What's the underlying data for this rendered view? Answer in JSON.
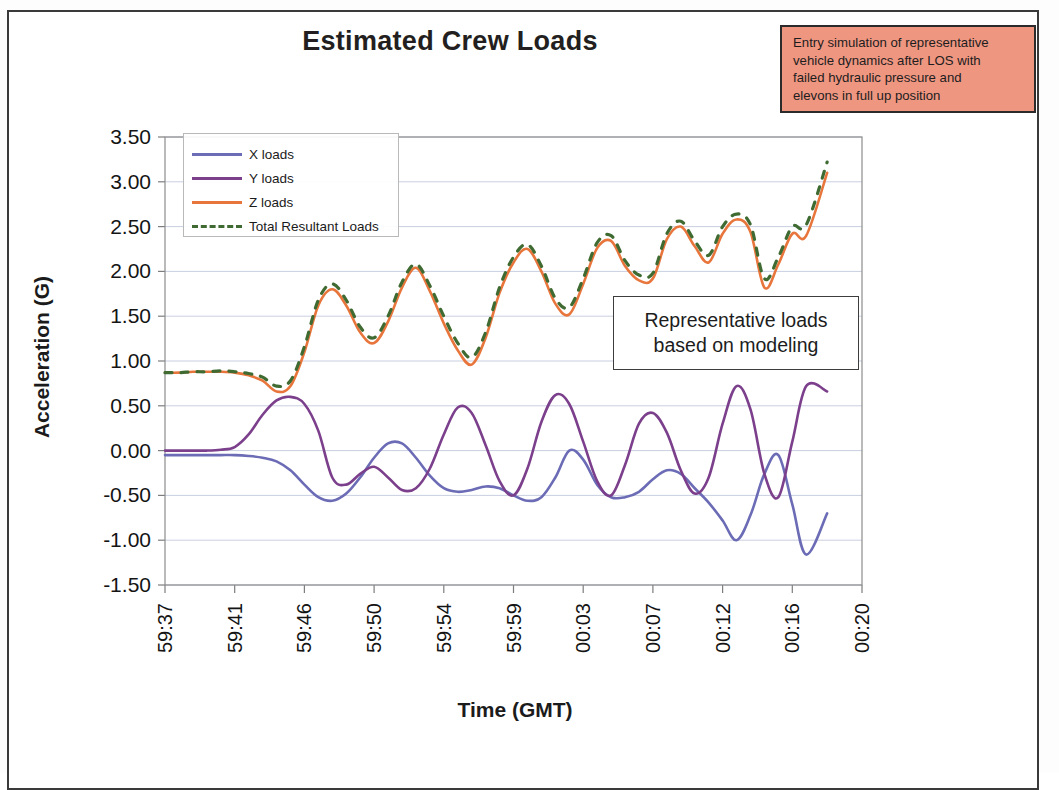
{
  "title": "Estimated Crew Loads",
  "annotations": {
    "red_note": "Entry simulation of representative vehicle dynamics after LOS with failed hydraulic pressure and elevons in full up position",
    "red_note_lines": [
      "Entry simulation of representative",
      "vehicle dynamics after LOS with",
      "failed hydraulic pressure and",
      "elevons in full up position"
    ],
    "white_note_line1": "Representative loads",
    "white_note_line2": "based on modeling"
  },
  "colors": {
    "x_loads": "#6b6cb5",
    "y_loads": "#7b3f8c",
    "z_loads": "#e8763c",
    "total_resultant": "#3f6b32",
    "red_note_bg": "#ef9681",
    "frame": "#3a3a3a",
    "grid": "#c9cfe0"
  },
  "chart_data": {
    "type": "line",
    "title": "Estimated Crew Loads",
    "xlabel": "Time (GMT)",
    "ylabel": "Acceleration (G)",
    "ylim": [
      -1.5,
      3.5
    ],
    "ytick_step": 0.5,
    "ytick_labels": [
      "3.50",
      "3.00",
      "2.50",
      "2.00",
      "1.50",
      "1.00",
      "0.50",
      "0.00",
      "-0.50",
      "-1.00",
      "-1.50"
    ],
    "xtick_labels": [
      "59:37",
      "59:41",
      "59:46",
      "59:50",
      "59:54",
      "59:59",
      "00:03",
      "00:07",
      "00:12",
      "00:16",
      "00:20"
    ],
    "grid": true,
    "legend_position": "top-left-inside",
    "x_range": [
      0,
      100
    ],
    "series": [
      {
        "name": "X loads",
        "color": "#6b6cb5",
        "style": "solid",
        "x": [
          0,
          2,
          4,
          6,
          8,
          10,
          12,
          14,
          16,
          18,
          20,
          22,
          24,
          26,
          28,
          30,
          32,
          34,
          36,
          38,
          40,
          42,
          44,
          46,
          48,
          50,
          52,
          54,
          56,
          58,
          60,
          62,
          64,
          66,
          68,
          70,
          72,
          74,
          76,
          78,
          80,
          82,
          84,
          86,
          88,
          90,
          92
        ],
        "values": [
          -0.05,
          -0.05,
          -0.05,
          -0.05,
          -0.05,
          -0.05,
          -0.06,
          -0.08,
          -0.12,
          -0.22,
          -0.38,
          -0.52,
          -0.56,
          -0.48,
          -0.3,
          -0.08,
          0.08,
          0.08,
          -0.08,
          -0.28,
          -0.42,
          -0.46,
          -0.44,
          -0.4,
          -0.42,
          -0.5,
          -0.56,
          -0.52,
          -0.3,
          0.0,
          -0.1,
          -0.38,
          -0.52,
          -0.52,
          -0.46,
          -0.32,
          -0.22,
          -0.26,
          -0.42,
          -0.58,
          -0.78,
          -1.0,
          -0.72,
          -0.26,
          -0.05,
          -0.6,
          -1.16
        ]
      },
      {
        "name": "Y loads",
        "color": "#7b3f8c",
        "style": "solid",
        "x": [
          0,
          2,
          4,
          6,
          8,
          10,
          12,
          14,
          16,
          18,
          20,
          22,
          24,
          26,
          28,
          30,
          32,
          34,
          36,
          38,
          40,
          42,
          44,
          46,
          48,
          50,
          52,
          54,
          56,
          58,
          60,
          62,
          64,
          66,
          68,
          70,
          72,
          74,
          76,
          78,
          80,
          82,
          84,
          86,
          88,
          90,
          92
        ],
        "values": [
          0.0,
          0.0,
          0.0,
          0.0,
          0.01,
          0.04,
          0.18,
          0.4,
          0.56,
          0.6,
          0.52,
          0.22,
          -0.3,
          -0.38,
          -0.26,
          -0.18,
          -0.3,
          -0.44,
          -0.42,
          -0.2,
          0.18,
          0.48,
          0.42,
          0.06,
          -0.34,
          -0.5,
          -0.2,
          0.32,
          0.62,
          0.52,
          0.1,
          -0.34,
          -0.5,
          -0.16,
          0.3,
          0.42,
          0.2,
          -0.22,
          -0.48,
          -0.3,
          0.3,
          0.72,
          0.46,
          -0.26,
          -0.52,
          0.1,
          0.72
        ]
      },
      {
        "name": "Z loads",
        "color": "#e8763c",
        "style": "solid",
        "x": [
          0,
          2,
          4,
          6,
          8,
          10,
          12,
          14,
          16,
          18,
          20,
          22,
          24,
          26,
          28,
          30,
          32,
          34,
          36,
          38,
          40,
          42,
          44,
          46,
          48,
          50,
          52,
          54,
          56,
          58,
          60,
          62,
          64,
          66,
          68,
          70,
          72,
          74,
          76,
          78,
          80,
          82,
          84,
          86,
          88,
          90,
          92
        ],
        "values": [
          0.87,
          0.87,
          0.88,
          0.88,
          0.88,
          0.87,
          0.84,
          0.78,
          0.66,
          0.72,
          1.1,
          1.62,
          1.8,
          1.62,
          1.32,
          1.2,
          1.44,
          1.82,
          2.04,
          1.78,
          1.42,
          1.12,
          0.96,
          1.26,
          1.76,
          2.1,
          2.25,
          2.0,
          1.64,
          1.52,
          1.86,
          2.26,
          2.34,
          2.06,
          1.9,
          1.92,
          2.36,
          2.5,
          2.28,
          2.1,
          2.42,
          2.58,
          2.44,
          1.82,
          2.08,
          2.42,
          2.4
        ]
      },
      {
        "name": "Total Resultant Loads",
        "color": "#3f6b32",
        "style": "dashed",
        "x": [
          0,
          2,
          4,
          6,
          8,
          10,
          12,
          14,
          16,
          18,
          20,
          22,
          24,
          26,
          28,
          30,
          32,
          34,
          36,
          38,
          40,
          42,
          44,
          46,
          48,
          50,
          52,
          54,
          56,
          58,
          60,
          62,
          64,
          66,
          68,
          70,
          72,
          74,
          76,
          78,
          80,
          82,
          84,
          86,
          88,
          90,
          92
        ],
        "values": [
          0.87,
          0.87,
          0.88,
          0.88,
          0.89,
          0.88,
          0.86,
          0.82,
          0.72,
          0.78,
          1.16,
          1.68,
          1.86,
          1.68,
          1.38,
          1.26,
          1.5,
          1.88,
          2.08,
          1.84,
          1.5,
          1.2,
          1.04,
          1.32,
          1.82,
          2.16,
          2.3,
          2.06,
          1.7,
          1.6,
          1.92,
          2.32,
          2.4,
          2.12,
          1.96,
          1.98,
          2.42,
          2.56,
          2.34,
          2.18,
          2.5,
          2.64,
          2.52,
          1.92,
          2.16,
          2.5,
          2.52
        ]
      }
    ],
    "series_tail": {
      "note": "curves continue past x=92 to x=95 rising toward 3.1 for Z/Total",
      "x_loads_end": -0.7,
      "y_loads_end": 0.66,
      "z_loads_end": 3.1,
      "total_end": 3.22
    }
  },
  "legend": {
    "items": [
      {
        "label": "X loads",
        "color": "#6b6cb5",
        "style": "solid"
      },
      {
        "label": "Y loads",
        "color": "#7b3f8c",
        "style": "solid"
      },
      {
        "label": "Z loads",
        "color": "#e8763c",
        "style": "solid"
      },
      {
        "label": "Total Resultant Loads",
        "color": "#3f6b32",
        "style": "dashed"
      }
    ]
  }
}
